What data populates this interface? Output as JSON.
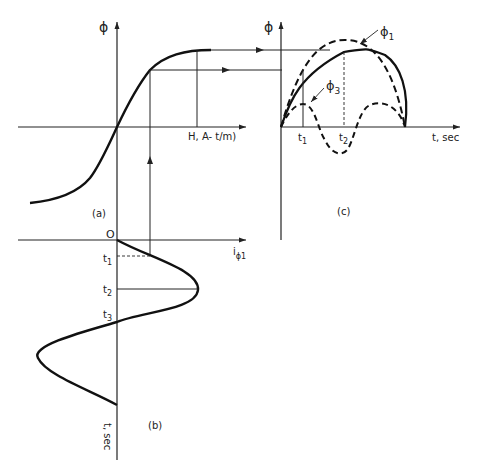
{
  "figure": {
    "panel_a": {
      "label": "(a)",
      "y_axis_label": "ϕ",
      "x_axis_label": "H, A- t/m)",
      "curve": "magnetization (B-H) saturation curve"
    },
    "panel_b": {
      "label": "(b)",
      "origin_label": "O",
      "x_axis_label_main": "i",
      "x_axis_label_sub": "ϕ1",
      "y_axis_label": "t, sec",
      "tick_labels": [
        {
          "main": "t",
          "sub": "1"
        },
        {
          "main": "t",
          "sub": "2"
        },
        {
          "main": "t",
          "sub": "3"
        }
      ],
      "curve": "sinusoidal magnetizing current"
    },
    "panel_c": {
      "label": "(c)",
      "y_axis_label": "ϕ",
      "x_axis_label": "t, sec",
      "tick_labels": [
        {
          "main": "t",
          "sub": "1"
        },
        {
          "main": "t",
          "sub": "2"
        }
      ],
      "curves": [
        {
          "name": "ϕ",
          "sub": "1",
          "style": "dashed",
          "desc": "fundamental flux"
        },
        {
          "name": "ϕ",
          "sub": "3",
          "style": "dashed",
          "desc": "third harmonic flux"
        },
        {
          "name": "ϕ",
          "sub": "",
          "style": "solid",
          "desc": "resultant flat-topped flux"
        }
      ]
    }
  }
}
